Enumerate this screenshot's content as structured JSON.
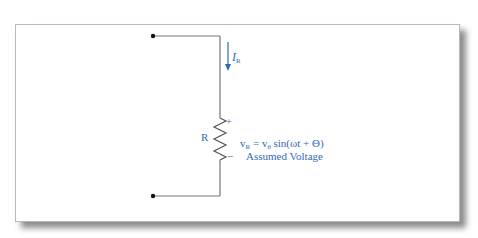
{
  "diagram": {
    "type": "circuit",
    "colors": {
      "wire": "#777777",
      "node": "#111111",
      "label": "#2e6bb3",
      "frame_border": "#b8b8b8"
    },
    "current": {
      "symbol": "I",
      "subscript": "R",
      "direction": "down"
    },
    "resistor": {
      "label": "R",
      "plus": "+",
      "minus": "−"
    },
    "voltage": {
      "lhs_symbol": "v",
      "lhs_subscript": "R",
      "equals": " = ",
      "amp_symbol": "v",
      "amp_subscript": "θ",
      "rhs_expr": " sin(ωt + Θ)",
      "caption": "Assumed Voltage"
    },
    "nodes": [
      {
        "name": "top-terminal"
      },
      {
        "name": "bottom-terminal"
      }
    ]
  }
}
